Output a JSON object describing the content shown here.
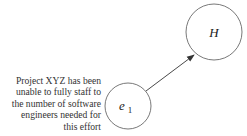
{
  "diagram": {
    "nodes": [
      {
        "id": "e1",
        "label_main": "e",
        "label_sub": "1"
      },
      {
        "id": "H",
        "label_main": "H"
      }
    ],
    "edges": [
      {
        "from": "e1",
        "to": "H"
      }
    ],
    "description": "Project XYZ has been unable to fully staff to the number of software engineers needed for this effort",
    "description_lines": [
      "Project XYZ has been",
      "unable to fully staff to",
      "the number of software",
      "engineers needed for",
      "this effort"
    ]
  }
}
